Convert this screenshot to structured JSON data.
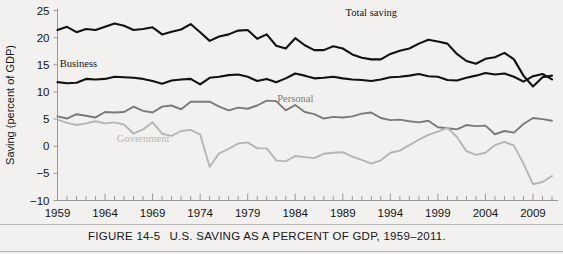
{
  "figure": {
    "caption_number": "FIGURE 14-5",
    "caption_title": "U.S. SAVING AS A PERCENT OF GDP, 1959–2011."
  },
  "chart_data": {
    "type": "line",
    "title": "",
    "xlabel": "",
    "ylabel": "Saving (percent of GDP)",
    "xlim": [
      1959,
      2011
    ],
    "ylim": [
      -10,
      25
    ],
    "ytick_labels": [
      "25",
      "20",
      "15",
      "10",
      "5",
      "0",
      "−5",
      "−10"
    ],
    "yticks": [
      25,
      20,
      15,
      10,
      5,
      0,
      -5,
      -10
    ],
    "xtick_labels": [
      "1959",
      "1964",
      "1969",
      "1974",
      "1979",
      "1984",
      "1989",
      "1994",
      "1999",
      "2004",
      "2009"
    ],
    "xticks": [
      1959,
      1964,
      1969,
      1974,
      1979,
      1984,
      1989,
      1994,
      1999,
      2004,
      2009
    ],
    "minor_xtick_step": 1,
    "grid": false,
    "legend_position": "inline-annotations",
    "x": [
      1959,
      1960,
      1961,
      1962,
      1963,
      1964,
      1965,
      1966,
      1967,
      1968,
      1969,
      1970,
      1971,
      1972,
      1973,
      1974,
      1975,
      1976,
      1977,
      1978,
      1979,
      1980,
      1981,
      1982,
      1983,
      1984,
      1985,
      1986,
      1987,
      1988,
      1989,
      1990,
      1991,
      1992,
      1993,
      1994,
      1995,
      1996,
      1997,
      1998,
      1999,
      2000,
      2001,
      2002,
      2003,
      2004,
      2005,
      2006,
      2007,
      2008,
      2009,
      2010,
      2011
    ],
    "series": [
      {
        "name": "Total saving",
        "color": "#111111",
        "width": 2.1,
        "label_x": 1992,
        "label_y": 24.0,
        "values": [
          21.4,
          22.0,
          21.0,
          21.6,
          21.4,
          22.0,
          22.6,
          22.2,
          21.4,
          21.6,
          21.9,
          20.6,
          21.1,
          21.5,
          22.5,
          21.0,
          19.4,
          20.2,
          20.6,
          21.3,
          21.4,
          19.8,
          20.6,
          18.5,
          18.0,
          19.9,
          18.6,
          17.7,
          17.7,
          18.4,
          18.0,
          16.9,
          16.3,
          16.0,
          16.0,
          17.0,
          17.6,
          18.0,
          18.9,
          19.6,
          19.3,
          18.9,
          17.0,
          15.7,
          15.2,
          16.1,
          16.4,
          17.2,
          16.0,
          13.0,
          11.0,
          12.7,
          13.0
        ]
      },
      {
        "name": "Business",
        "color": "#111111",
        "width": 2.1,
        "label_x": 1961.2,
        "label_y": 14.6,
        "values": [
          11.8,
          11.6,
          11.7,
          12.4,
          12.3,
          12.4,
          12.8,
          12.7,
          12.6,
          12.4,
          12.0,
          11.5,
          12.1,
          12.3,
          12.4,
          11.4,
          12.6,
          12.8,
          13.1,
          13.2,
          12.8,
          12.0,
          12.4,
          11.8,
          12.5,
          13.4,
          13.0,
          12.5,
          12.6,
          12.8,
          12.5,
          12.3,
          12.2,
          12.0,
          12.3,
          12.7,
          12.8,
          13.0,
          13.3,
          12.9,
          12.8,
          12.2,
          12.1,
          12.6,
          13.0,
          13.5,
          13.2,
          13.4,
          12.8,
          11.9,
          12.9,
          13.3,
          12.3
        ]
      },
      {
        "name": "Personal",
        "color": "#7a7a7a",
        "width": 1.9,
        "label_x": 1984.0,
        "label_y": 8.2,
        "values": [
          5.5,
          5.1,
          5.9,
          5.6,
          5.3,
          6.3,
          6.2,
          6.3,
          7.3,
          6.5,
          6.2,
          7.3,
          7.5,
          6.8,
          8.2,
          8.2,
          8.2,
          7.3,
          6.6,
          7.1,
          6.9,
          7.5,
          8.4,
          8.3,
          6.6,
          7.6,
          6.3,
          5.9,
          5.1,
          5.4,
          5.3,
          5.5,
          6.0,
          6.2,
          5.2,
          4.8,
          4.9,
          4.6,
          4.4,
          4.7,
          3.5,
          3.3,
          3.1,
          3.9,
          3.7,
          3.8,
          2.2,
          2.8,
          2.5,
          4.1,
          5.2,
          5.0,
          4.7
        ]
      },
      {
        "name": "Government",
        "color": "#b6b5b2",
        "width": 1.9,
        "label_x": 1968.0,
        "label_y": 0.7,
        "values": [
          4.9,
          4.3,
          3.9,
          4.2,
          4.6,
          4.2,
          4.4,
          4.0,
          2.3,
          3.1,
          4.4,
          2.3,
          1.9,
          2.8,
          3.0,
          2.2,
          -3.8,
          -1.3,
          -0.5,
          0.5,
          0.7,
          -0.4,
          -0.4,
          -2.6,
          -2.8,
          -1.8,
          -2.0,
          -2.2,
          -1.4,
          -1.2,
          -1.1,
          -1.9,
          -2.5,
          -3.2,
          -2.6,
          -1.2,
          -0.8,
          0.2,
          1.2,
          2.1,
          2.7,
          3.4,
          1.7,
          -0.9,
          -1.6,
          -1.2,
          0.2,
          0.8,
          0.1,
          -3.2,
          -7.0,
          -6.6,
          -5.5
        ]
      }
    ]
  }
}
